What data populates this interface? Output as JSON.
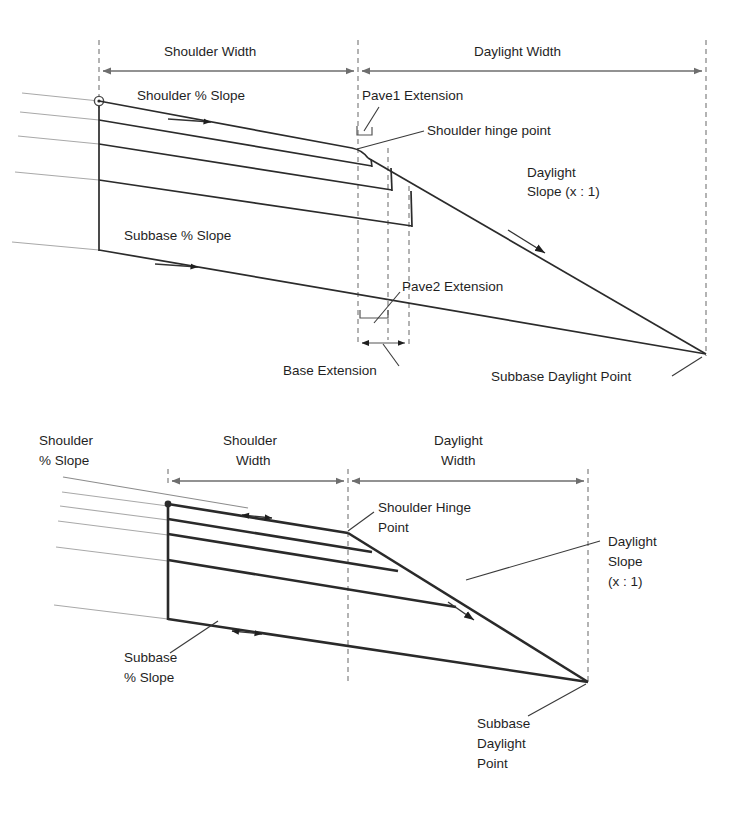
{
  "figure": {
    "colors": {
      "line_dark": "#2b2b2b",
      "line_ghost": "#a9a9a9",
      "dashed_guide": "#9a9a9a",
      "dimension": "#6e6e6e",
      "background": "#ffffff",
      "text": "#1f1f1f"
    }
  },
  "top_diagram": {
    "name": "Pavement section with pave/base extensions",
    "dimensions": [
      {
        "id": "shoulder-width",
        "label": "Shoulder Width"
      },
      {
        "id": "daylight-width",
        "label": "Daylight Width"
      },
      {
        "id": "base-extension",
        "label": "Base Extension"
      }
    ],
    "labels": [
      {
        "id": "shoulder-pct-slope",
        "label": "Shoulder % Slope"
      },
      {
        "id": "pave1-extension",
        "label": "Pave1 Extension"
      },
      {
        "id": "shoulder-hinge-point",
        "label": "Shoulder hinge point"
      },
      {
        "id": "daylight-slope-line1",
        "label": "Daylight"
      },
      {
        "id": "daylight-slope-line2",
        "label": "Slope (x : 1)"
      },
      {
        "id": "subbase-pct-slope",
        "label": "Subbase % Slope"
      },
      {
        "id": "pave2-extension",
        "label": "Pave2 Extension"
      },
      {
        "id": "subbase-daylight-point",
        "label": "Subbase Daylight Point"
      }
    ]
  },
  "bottom_diagram": {
    "name": "Simplified section with shoulder hinge and daylight slope",
    "dimensions": [
      {
        "id": "shoulder-width-line1",
        "label": "Shoulder"
      },
      {
        "id": "shoulder-width-line2",
        "label": "Width"
      },
      {
        "id": "daylight-width-line1",
        "label": "Daylight"
      },
      {
        "id": "daylight-width-line2",
        "label": "Width"
      }
    ],
    "labels": [
      {
        "id": "shoulder-pct-slope-line1",
        "label": "Shoulder"
      },
      {
        "id": "shoulder-pct-slope-line2",
        "label": "% Slope"
      },
      {
        "id": "shoulder-hinge-point-line1",
        "label": "Shoulder Hinge"
      },
      {
        "id": "shoulder-hinge-point-line2",
        "label": "Point"
      },
      {
        "id": "daylight-slope-line1",
        "label": "Daylight"
      },
      {
        "id": "daylight-slope-line2",
        "label": "Slope"
      },
      {
        "id": "daylight-slope-line3",
        "label": "(x : 1)"
      },
      {
        "id": "subbase-pct-slope-line1",
        "label": "Subbase"
      },
      {
        "id": "subbase-pct-slope-line2",
        "label": "% Slope"
      },
      {
        "id": "subbase-daylight-point-line1",
        "label": "Subbase"
      },
      {
        "id": "subbase-daylight-point-line2",
        "label": "Daylight"
      },
      {
        "id": "subbase-daylight-point-line3",
        "label": "Point"
      }
    ]
  }
}
